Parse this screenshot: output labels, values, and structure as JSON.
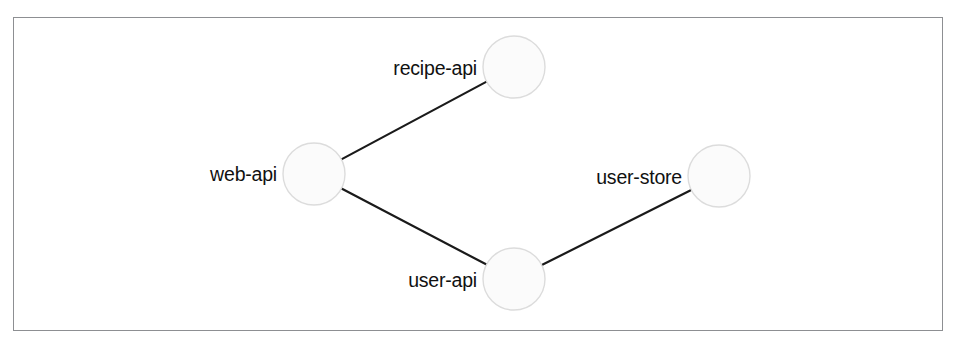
{
  "figure": {
    "type": "node-graph",
    "background_color": "#ffffff",
    "frame": {
      "x": 13,
      "y": 17,
      "width": 930,
      "height": 314,
      "border_color": "#8d8f92",
      "border_width": 1.5
    }
  },
  "style": {
    "node_fill": "#fbfbfb",
    "node_stroke": "#dcdcdc",
    "node_stroke_width": 1.4,
    "node_radius": 31,
    "edge_color": "#1a1a1a",
    "edge_width": 2.2,
    "label_color": "#111111",
    "label_font_size": 19.5
  },
  "graph_data": {
    "type": "graph",
    "title": "",
    "directed": false,
    "nodes": [
      {
        "id": "recipe-api",
        "label": "recipe-api",
        "x": 514,
        "y": 67,
        "r": 31,
        "label_x": 477,
        "label_y": 68
      },
      {
        "id": "web-api",
        "label": "web-api",
        "x": 314,
        "y": 174,
        "r": 31,
        "label_x": 277,
        "label_y": 174
      },
      {
        "id": "user-store",
        "label": "user-store",
        "x": 719,
        "y": 176,
        "r": 31,
        "label_x": 682,
        "label_y": 177
      },
      {
        "id": "user-api",
        "label": "user-api",
        "x": 514,
        "y": 279,
        "r": 31,
        "label_x": 477,
        "label_y": 280
      }
    ],
    "edges": [
      {
        "source": "web-api",
        "target": "recipe-api"
      },
      {
        "source": "web-api",
        "target": "user-api"
      },
      {
        "source": "user-api",
        "target": "user-store"
      }
    ]
  }
}
